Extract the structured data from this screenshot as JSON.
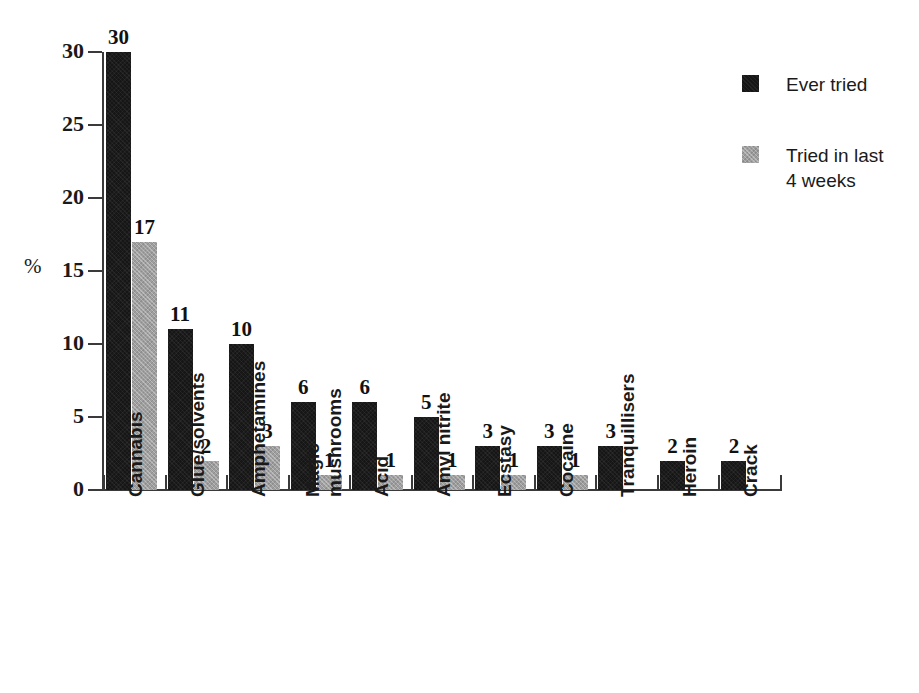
{
  "chart_data": {
    "type": "bar",
    "title": "",
    "xlabel": "",
    "ylabel": "%",
    "ylim": [
      0,
      30
    ],
    "yticks": [
      0,
      5,
      10,
      15,
      20,
      25,
      30
    ],
    "grid": false,
    "legend_position": "top-right",
    "categories": [
      "Cannabis",
      "Glue/solvents",
      "Amphetamines",
      "Magic mushrooms",
      "Acid",
      "Amyl nitrite",
      "Ecstasy",
      "Cocaine",
      "Tranquillisers",
      "Heroin",
      "Crack"
    ],
    "category_lines": [
      [
        "Cannabis"
      ],
      [
        "Glue/solvents"
      ],
      [
        "Amphetamines"
      ],
      [
        "Magic",
        "mushrooms"
      ],
      [
        "Acid"
      ],
      [
        "Amyl nitrite"
      ],
      [
        "Ecstasy"
      ],
      [
        "Cocaine"
      ],
      [
        "Tranquillisers"
      ],
      [
        "Heroin"
      ],
      [
        "Crack"
      ]
    ],
    "series": [
      {
        "name": "Ever tried",
        "color": "#161616",
        "values": [
          30,
          11,
          10,
          6,
          6,
          5,
          3,
          3,
          3,
          2,
          2
        ]
      },
      {
        "name": "Tried in last 4 weeks",
        "color": "#9e9e9e",
        "values": [
          17,
          2,
          3,
          1,
          1,
          1,
          1,
          1,
          null,
          null,
          null
        ]
      }
    ]
  },
  "legend": {
    "items": [
      {
        "label": "Ever tried",
        "swatch": "dark"
      },
      {
        "label": "Tried in last\n4 weeks",
        "swatch": "light",
        "line1": "Tried in last",
        "line2": "4 weeks"
      }
    ]
  },
  "axis": {
    "y_unit_label": "%",
    "y_tick_labels": [
      "30",
      "25",
      "20",
      "15",
      "10",
      "5",
      "0"
    ]
  }
}
